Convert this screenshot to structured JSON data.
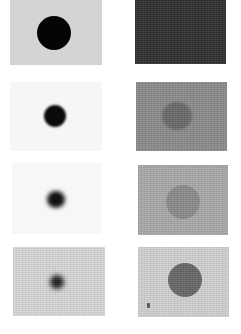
{
  "figure": {
    "layout": "4 rows x 2 columns grid of grayscale image panels",
    "panels": [
      {
        "row": 1,
        "col": "left",
        "background": "#d4d4d4",
        "spot": {
          "color": "#050505",
          "diameter": 34,
          "blur": 0
        }
      },
      {
        "row": 1,
        "col": "right",
        "background": "#2e2e2e",
        "spot": null
      },
      {
        "row": 2,
        "col": "left",
        "background": "#f6f6f6",
        "spot": {
          "color": "#0a0a0a",
          "diameter": 22,
          "blur": 1
        }
      },
      {
        "row": 2,
        "col": "right",
        "background": "#8a8a8a",
        "spot": {
          "color": "#686868",
          "diameter": 30,
          "blur": 1
        }
      },
      {
        "row": 3,
        "col": "left",
        "background": "#f7f7f7",
        "spot": {
          "color": "#111111",
          "diameter": 18,
          "blur": 2
        }
      },
      {
        "row": 3,
        "col": "right",
        "background": "#a8a8a8",
        "spot": {
          "color": "#8a8a8a",
          "diameter": 34,
          "blur": 0
        }
      },
      {
        "row": 4,
        "col": "left",
        "background": "#d6d6d6",
        "spot": {
          "color": "#1a1a1a",
          "diameter": 14,
          "blur": 2.5
        }
      },
      {
        "row": 4,
        "col": "right",
        "background": "#d0d0d0",
        "spot": {
          "color": "#666666",
          "diameter": 34,
          "blur": 0
        }
      }
    ]
  }
}
